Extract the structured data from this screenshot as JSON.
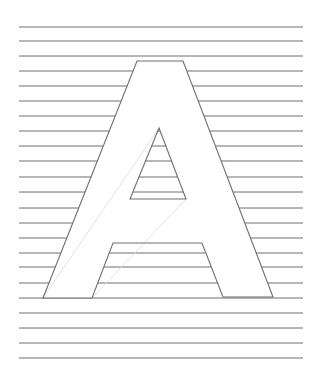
{
  "image": {
    "description": "Hand-drawn letter A outline over horizontal ruled lines",
    "letter": "A",
    "background_color": "#ffffff",
    "line_color": "#6f6f6f",
    "guide_color": "#e2e2e2"
  },
  "ruled_lines": {
    "x_start": 19,
    "x_end": 303,
    "y_positions": [
      27,
      41,
      56,
      71,
      86,
      101,
      116,
      131,
      146,
      161,
      177,
      192,
      208,
      223,
      238,
      253,
      267,
      283,
      298,
      313,
      328,
      343,
      358
    ]
  },
  "letter_a": {
    "outer": [
      [
        43,
        298
      ],
      [
        137,
        61
      ],
      [
        183,
        61
      ],
      [
        273,
        297
      ],
      [
        223,
        297
      ],
      [
        202,
        243
      ],
      [
        113,
        243
      ],
      [
        92,
        298
      ]
    ],
    "counter_triangle": [
      [
        159,
        128
      ],
      [
        186,
        199
      ],
      [
        130,
        199
      ]
    ],
    "guides": [
      [
        [
          43,
          298
        ],
        [
          159,
          128
        ]
      ],
      [
        [
          92,
          298
        ],
        [
          186,
          199
        ]
      ]
    ]
  }
}
